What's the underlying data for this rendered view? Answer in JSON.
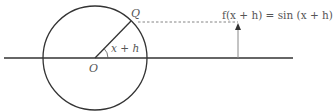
{
  "diagram": {
    "type": "unit-circle-sine",
    "labels": {
      "point_q": "Q",
      "origin": "O",
      "angle": "x + h",
      "formula": "f(x + h) = sin (x + h)"
    },
    "colors": {
      "stroke": "#333333",
      "arrow": "#777777",
      "dashed": "#666666",
      "text": "#555555"
    }
  }
}
